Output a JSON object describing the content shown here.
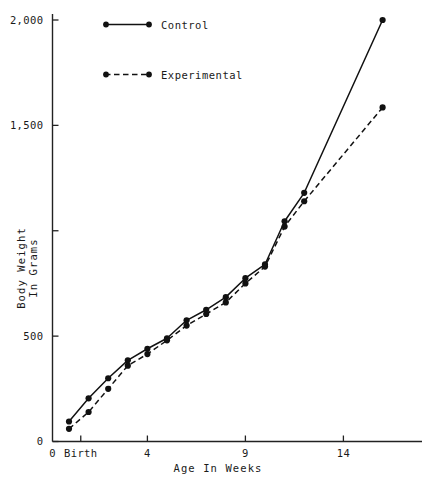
{
  "chart_data": {
    "type": "line",
    "title": "",
    "xlabel": "Age In Weeks",
    "ylabel": "Body Weight\nIn Grams",
    "ylabel_line1": "Body Weight",
    "ylabel_line2": "In Grams",
    "xlim": [
      0,
      18
    ],
    "ylim": [
      0,
      2000
    ],
    "grid": false,
    "legend_position": "top-left-inside",
    "y_ticks": [
      0,
      500,
      1000,
      1500,
      2000
    ],
    "y_tick_labels": [
      "0",
      "500",
      "",
      "1,500",
      "2,000"
    ],
    "x_ticks": [
      0,
      0.6,
      4,
      9,
      14
    ],
    "x_tick_labels": [
      "0",
      "Birth",
      "4",
      "9",
      "14"
    ],
    "x": [
      0,
      1,
      2,
      3,
      4,
      5,
      6,
      7,
      8,
      9,
      10,
      11,
      12,
      16
    ],
    "series": [
      {
        "name": "Control",
        "style": "solid",
        "marker": "filled-circle",
        "values": [
          95,
          205,
          300,
          385,
          440,
          490,
          575,
          625,
          685,
          775,
          840,
          1045,
          1180,
          2000
        ]
      },
      {
        "name": "Experimental",
        "style": "dashed",
        "marker": "filled-circle",
        "values": [
          60,
          140,
          250,
          360,
          415,
          480,
          550,
          605,
          660,
          750,
          830,
          1020,
          1140,
          1585
        ]
      }
    ]
  },
  "legend": {
    "entries": [
      {
        "label": "Control",
        "style": "solid"
      },
      {
        "label": "Experimental",
        "style": "dashed"
      }
    ]
  },
  "axes": {
    "x_title": "Age In Weeks",
    "y_title_line1": "Body Weight",
    "y_title_line2": "In Grams"
  }
}
